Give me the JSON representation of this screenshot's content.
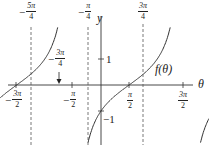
{
  "chart_data": {
    "type": "line",
    "title": "",
    "function_label": "f(θ)",
    "xlabel": "θ",
    "ylabel": "y",
    "function": "tan(θ - π/4)",
    "xlim": [
      -1.65,
      1.75
    ],
    "ylim": [
      -2.6,
      3.0
    ],
    "x_ticks": [
      {
        "value": -4.712,
        "label_sign": "−",
        "label_num": "3π",
        "label_den": "2"
      },
      {
        "value": -1.571,
        "label_sign": "−",
        "label_num": "π",
        "label_den": "2"
      },
      {
        "value": 1.571,
        "label_sign": "",
        "label_num": "π",
        "label_den": "2"
      },
      {
        "value": 4.712,
        "label_sign": "",
        "label_num": "3π",
        "label_den": "2"
      }
    ],
    "y_ticks": [
      {
        "value": 1,
        "label": "1"
      },
      {
        "value": -1,
        "label": "−1"
      }
    ],
    "asymptotes": [
      {
        "value": -3.927,
        "label_sign": "−",
        "label_num": "5π",
        "label_den": "4"
      },
      {
        "value": -0.785,
        "label_sign": "−",
        "label_num": "π",
        "label_den": "4"
      },
      {
        "value": 2.356,
        "label_sign": "",
        "label_num": "3π",
        "label_den": "4"
      }
    ],
    "annotations": [
      {
        "text_sign": "−",
        "text_num": "3π",
        "text_den": "4",
        "points_to_x": -2.356,
        "points_to_y": 0,
        "arrow": true
      }
    ],
    "grid": false,
    "legend": "none"
  }
}
